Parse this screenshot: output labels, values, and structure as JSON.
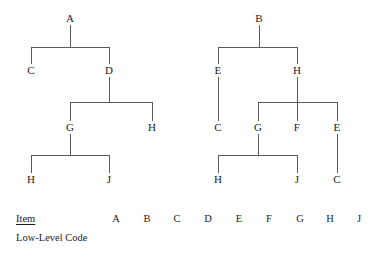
{
  "figure": {
    "title_text": "",
    "line_color": "#5a5a5a",
    "text_color": "#1c1c1c",
    "background": "#ffffff"
  },
  "trees": [
    {
      "name": "left-product-structure-tree",
      "root": "A",
      "nodes": [
        {
          "id": "L-A",
          "label": "A",
          "x": 70,
          "y": 18
        },
        {
          "id": "L-C",
          "label": "C",
          "x": 31,
          "y": 70
        },
        {
          "id": "L-D",
          "label": "D",
          "x": 109,
          "y": 70
        },
        {
          "id": "L-G",
          "label": "G",
          "x": 70,
          "y": 127
        },
        {
          "id": "L-H1",
          "label": "H",
          "x": 152,
          "y": 127
        },
        {
          "id": "L-H2",
          "label": "H",
          "x": 31,
          "y": 179
        },
        {
          "id": "L-J",
          "label": "J",
          "x": 109,
          "y": 179
        }
      ],
      "edges": [
        {
          "parent": "L-A",
          "children": [
            "L-C",
            "L-D"
          ]
        },
        {
          "parent": "L-D",
          "children": [
            "L-G",
            "L-H1"
          ]
        },
        {
          "parent": "L-G",
          "children": [
            "L-H2",
            "L-J"
          ]
        }
      ]
    },
    {
      "name": "right-product-structure-tree",
      "root": "B",
      "nodes": [
        {
          "id": "R-B",
          "label": "B",
          "x": 259,
          "y": 18
        },
        {
          "id": "R-E1",
          "label": "E",
          "x": 218,
          "y": 70
        },
        {
          "id": "R-H1",
          "label": "H",
          "x": 297,
          "y": 70
        },
        {
          "id": "R-C1",
          "label": "C",
          "x": 218,
          "y": 127
        },
        {
          "id": "R-G",
          "label": "G",
          "x": 258,
          "y": 127
        },
        {
          "id": "R-F",
          "label": "F",
          "x": 297,
          "y": 127
        },
        {
          "id": "R-E2",
          "label": "E",
          "x": 337,
          "y": 127
        },
        {
          "id": "R-H2",
          "label": "H",
          "x": 218,
          "y": 179
        },
        {
          "id": "R-J",
          "label": "J",
          "x": 297,
          "y": 179
        },
        {
          "id": "R-C2",
          "label": "C",
          "x": 337,
          "y": 179
        }
      ],
      "edges": [
        {
          "parent": "R-B",
          "children": [
            "R-E1",
            "R-H1"
          ]
        },
        {
          "parent": "R-E1",
          "children": [
            "R-C1"
          ]
        },
        {
          "parent": "R-H1",
          "children": [
            "R-G",
            "R-F",
            "R-E2"
          ]
        },
        {
          "parent": "R-G",
          "children": [
            "R-H2",
            "R-J"
          ]
        },
        {
          "parent": "R-E2",
          "children": [
            "R-C2"
          ]
        }
      ]
    }
  ],
  "legend": {
    "item_row_label": "Item",
    "low_level_code_row_label": "Low-Level Code",
    "item_columns": [
      "A",
      "B",
      "C",
      "D",
      "E",
      "F",
      "G",
      "H",
      "J"
    ],
    "low_level_code_values": [
      "",
      "",
      "",
      "",
      "",
      "",
      "",
      "",
      ""
    ]
  }
}
